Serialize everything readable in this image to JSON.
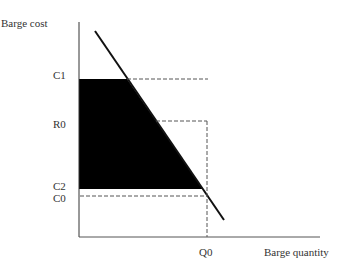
{
  "axes": {
    "y_label": "Barge cost",
    "x_label": "Barge quantity"
  },
  "y_ticks": {
    "c1": "C1",
    "r0": "R0",
    "c2": "C2",
    "c0": "C0"
  },
  "x_ticks": {
    "q0": "Q0"
  },
  "colors": {
    "fill": "#000000",
    "line": "#111111",
    "dashed": "#555555"
  }
}
